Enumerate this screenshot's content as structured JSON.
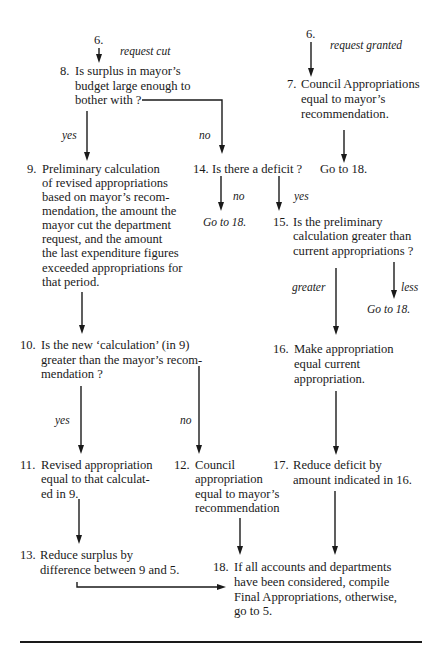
{
  "flowchart": {
    "entry_left": {
      "label": "6.",
      "branch": "request cut"
    },
    "entry_right": {
      "label": "6.",
      "branch": "request granted"
    },
    "nodes": {
      "n8": {
        "num": "8.",
        "lines": [
          "Is surplus in mayor’s",
          "budget large enough to",
          "bother with ?"
        ]
      },
      "n7": {
        "num": "7.",
        "lines": [
          "Council Appropriations",
          "equal to mayor’s",
          "recommendation."
        ]
      },
      "n7_goto": "Go to 18.",
      "n9": {
        "num": "9.",
        "lines": [
          "Preliminary calculation",
          "of revised appropriations",
          "based on mayor’s recom-",
          "mendation, the amount the",
          "mayor cut the department",
          "request, and the amount",
          "the last expenditure figures",
          "exceeded appropriations for",
          "that period."
        ]
      },
      "n14": {
        "num": "14.",
        "lines": [
          "Is there a deficit ?"
        ]
      },
      "n14_goto": "Go to 18.",
      "n15": {
        "num": "15.",
        "lines": [
          "Is the preliminary",
          "calculation greater than",
          "current appropriations ?"
        ]
      },
      "n15_goto": "Go to 18.",
      "n10": {
        "num": "10.",
        "lines": [
          "Is the new ‘calculation’ (in 9)",
          "greater than the mayor’s recom-",
          "mendation ?"
        ]
      },
      "n16": {
        "num": "16.",
        "lines": [
          "Make appropriation",
          "equal current",
          "appropriation."
        ]
      },
      "n11": {
        "num": "11.",
        "lines": [
          "Revised appropriation",
          "equal to that calculat-",
          "ed in 9."
        ]
      },
      "n12": {
        "num": "12.",
        "lines": [
          "Council",
          "appropriation",
          "equal to mayor’s",
          "recommendation"
        ]
      },
      "n17": {
        "num": "17.",
        "lines": [
          "Reduce deficit by",
          "amount indicated in 16."
        ]
      },
      "n13": {
        "num": "13.",
        "lines": [
          "Reduce surplus by",
          "difference between 9 and 5."
        ]
      },
      "n18": {
        "num": "18.",
        "lines": [
          "If all accounts and departments",
          "have been considered, compile",
          "Final Appropriations, otherwise,",
          "go to 5."
        ]
      }
    },
    "edge_labels": {
      "n8_yes": "yes",
      "n8_no": "no",
      "n14_no": "no",
      "n14_yes": "yes",
      "n15_greater": "greater",
      "n15_less": "less",
      "n10_yes": "yes",
      "n10_no": "no"
    }
  }
}
